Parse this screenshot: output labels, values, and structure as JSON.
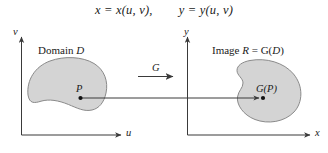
{
  "figure": {
    "equation": {
      "left": "x = x(u, v),",
      "right": "y = y(u, v)"
    },
    "colors": {
      "blob_fill": "#d4d4d4",
      "blob_stroke": "#8a8a8a",
      "axis": "#3a3a3a",
      "arrow": "#3a3a3a",
      "text": "#1a1a1a",
      "background": "#ffffff"
    },
    "left_panel": {
      "region_label_prefix": "Domain ",
      "region_label_symbol": "ᴰ",
      "region_label_script": "D",
      "vertical_axis_label": "v",
      "horizontal_axis_label": "u",
      "point_label": "P"
    },
    "right_panel": {
      "region_label_prefix": "Image ",
      "region_label_script_r": "R",
      "region_label_middle": " = G(",
      "region_label_script_d": "D",
      "region_label_suffix": ")",
      "vertical_axis_label": "y",
      "horizontal_axis_label": "x",
      "point_label": "G(P)"
    },
    "mapping": {
      "arrow_label": "G"
    }
  }
}
